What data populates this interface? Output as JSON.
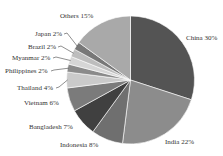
{
  "chart_data": {
    "type": "pie",
    "title": "",
    "start": "12 o'clock",
    "direction": "clockwise",
    "slices": [
      {
        "label": "China",
        "value": 30,
        "text": "China 30%",
        "color": "#545454"
      },
      {
        "label": "India",
        "value": 22,
        "text": "India 22%",
        "color": "#8c8c8c"
      },
      {
        "label": "Indonesia",
        "value": 8,
        "text": "Indonesia 8%",
        "color": "#6f6f6f"
      },
      {
        "label": "Bangladesh",
        "value": 7,
        "text": "Bangladesh 7%",
        "color": "#404040"
      },
      {
        "label": "Vietnam",
        "value": 6,
        "text": "Vietnam 6%",
        "color": "#7b7b7b"
      },
      {
        "label": "Thailand",
        "value": 4,
        "text": "Thailand 4%",
        "color": "#cacaca"
      },
      {
        "label": "Philippines",
        "value": 2,
        "text": "Philippines 2%",
        "color": "#8a8a8a"
      },
      {
        "label": "Myanmar",
        "value": 2,
        "text": "Myanmar 2%",
        "color": "#d6d6d6"
      },
      {
        "label": "Brazil",
        "value": 2,
        "text": "Brazil 2%",
        "color": "#bdbdbd"
      },
      {
        "label": "Japan",
        "value": 2,
        "text": "Japan 2%",
        "color": "#787878"
      },
      {
        "label": "Others",
        "value": 15,
        "text": "Others 15%",
        "color": "#a9a9a9"
      }
    ],
    "legend": "none (labels beside slices)"
  }
}
